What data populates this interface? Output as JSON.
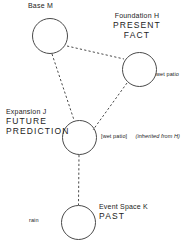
{
  "diagram": {
    "line_color": "#4a4a4a",
    "text_color": "#222222",
    "background": "#ffffff",
    "nodes": [
      {
        "id": "base",
        "name": "Base  M",
        "role_lines": [],
        "cx": 50,
        "cy": 36,
        "r": 18
      },
      {
        "id": "foundation",
        "name": "Foundation  H",
        "role_lines": [
          "PRESENT",
          "FACT"
        ],
        "cx": 139.5,
        "cy": 69.5,
        "r": 17.5
      },
      {
        "id": "expansion",
        "name": "Expansion  J",
        "role_lines": [
          "FUTURE",
          "PREDICTION"
        ],
        "cx": 79.5,
        "cy": 137.5,
        "r": 17.5
      },
      {
        "id": "event",
        "name": "Event Space  K",
        "role_lines": [
          "PAST"
        ],
        "cx": 78.5,
        "cy": 222.5,
        "r": 17.5
      }
    ],
    "edges": [
      {
        "id": "base-foundation",
        "from": "base",
        "to": "foundation",
        "style": "dashed"
      },
      {
        "id": "base-expansion",
        "from": "base",
        "to": "expansion",
        "style": "dashed"
      },
      {
        "id": "foundation-expansion",
        "from": "foundation",
        "to": "expansion",
        "style": "dashed"
      },
      {
        "id": "expansion-event",
        "from": "expansion",
        "to": "event",
        "style": "dashed"
      }
    ],
    "annotations": [
      {
        "id": "wet-patio-fact",
        "text": "wet patio",
        "attached_to": "foundation"
      },
      {
        "id": "wet-patio-inherited",
        "text": "[wet patio]",
        "attached_to": "expansion"
      },
      {
        "id": "inherited-from-h",
        "text": "(inherited from H)",
        "attached_to": "expansion",
        "italic": true
      },
      {
        "id": "rain",
        "text": "rain",
        "attached_to": "event"
      }
    ]
  }
}
